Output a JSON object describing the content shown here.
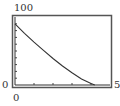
{
  "chart_data": {
    "type": "line",
    "title": "",
    "xlabel": "",
    "ylabel": "",
    "xlim": [
      0,
      5
    ],
    "ylim": [
      0,
      100
    ],
    "x_tick_labels": {
      "xmin": "0",
      "xmax": "5"
    },
    "y_tick_labels": {
      "ymin": "0",
      "ymax": "100"
    },
    "x_ticks": [
      1,
      2,
      3,
      4
    ],
    "y_ticks": [
      10,
      20,
      30,
      40,
      50,
      60,
      70,
      80,
      90
    ],
    "grid": false,
    "legend": null,
    "series": [
      {
        "name": "curve",
        "x": [
          0,
          0.5,
          1,
          1.5,
          2,
          2.5,
          3,
          3.5,
          4,
          4.2
        ],
        "y": [
          90,
          76,
          63,
          51,
          39,
          28,
          18,
          9,
          2,
          0
        ]
      }
    ],
    "colors": {
      "curve": "#333333",
      "frame": "#444444"
    }
  },
  "labels": {
    "ymax": "100",
    "ymin": "0",
    "xmin": "0",
    "xmax": "5"
  }
}
